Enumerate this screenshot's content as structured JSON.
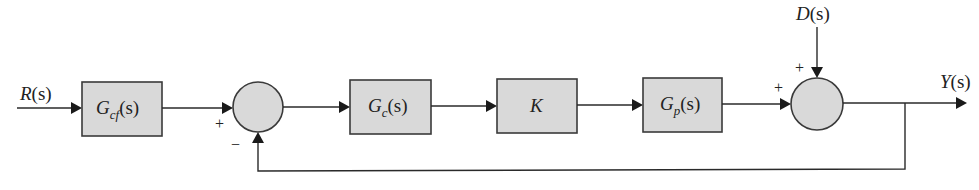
{
  "diagram": {
    "type": "block-diagram",
    "input": {
      "label": "R(s)",
      "main": "R",
      "arg": "(s)"
    },
    "output": {
      "label": "Y(s)",
      "main": "Y",
      "arg": "(s)"
    },
    "disturbance": {
      "label": "D(s)",
      "main": "D",
      "arg": "(s)"
    },
    "blocks": [
      {
        "id": "Gcf",
        "label": "Gcf(s)",
        "main": "G",
        "sub": "cf",
        "arg": "(s)"
      },
      {
        "id": "Gc",
        "label": "Gc(s)",
        "main": "G",
        "sub": "c",
        "arg": "(s)"
      },
      {
        "id": "K",
        "label": "K",
        "main": "K",
        "sub": "",
        "arg": ""
      },
      {
        "id": "Gp",
        "label": "Gp(s)",
        "main": "G",
        "sub": "p",
        "arg": "(s)"
      }
    ],
    "summing_junctions": [
      {
        "id": "sum1",
        "signs": {
          "left": "+",
          "bottom": "−"
        }
      },
      {
        "id": "sum2",
        "signs": {
          "left": "+",
          "top": "+"
        }
      }
    ],
    "connections": [
      "R(s) -> Gcf(s)",
      "Gcf(s) -> sum1 (+)",
      "sum1 -> Gc(s)",
      "Gc(s) -> K",
      "K -> Gp(s)",
      "Gp(s) -> sum2 (+)",
      "D(s) -> sum2 (+)",
      "sum2 -> Y(s)",
      "Y(s) -> sum1 (−) feedback"
    ],
    "colors": {
      "block_fill": "#d9d9d9",
      "stroke": "#3a3a3a",
      "background": "#ffffff"
    }
  }
}
